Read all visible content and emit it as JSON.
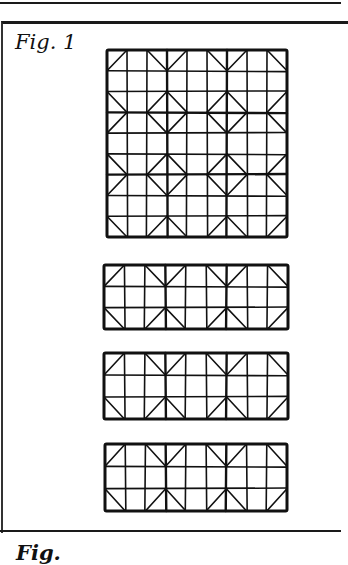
{
  "page": {
    "figure_label": "Fig. 1",
    "next_figure_label": "Fig."
  },
  "figures": [
    {
      "name": "grid-3x3-blocks",
      "x": 107,
      "y": 50,
      "w": 180,
      "h": 187,
      "cols": 9,
      "rows": 9
    },
    {
      "name": "strip-1",
      "x": 104,
      "y": 265,
      "w": 184,
      "h": 64,
      "cols": 9,
      "rows": 3
    },
    {
      "name": "strip-2",
      "x": 104,
      "y": 353,
      "w": 184,
      "h": 66,
      "cols": 9,
      "rows": 3
    },
    {
      "name": "strip-3",
      "x": 105,
      "y": 444,
      "w": 182,
      "h": 67,
      "cols": 9,
      "rows": 3
    }
  ],
  "colors": {
    "ink": "#111111",
    "paper": "#ffffff"
  }
}
